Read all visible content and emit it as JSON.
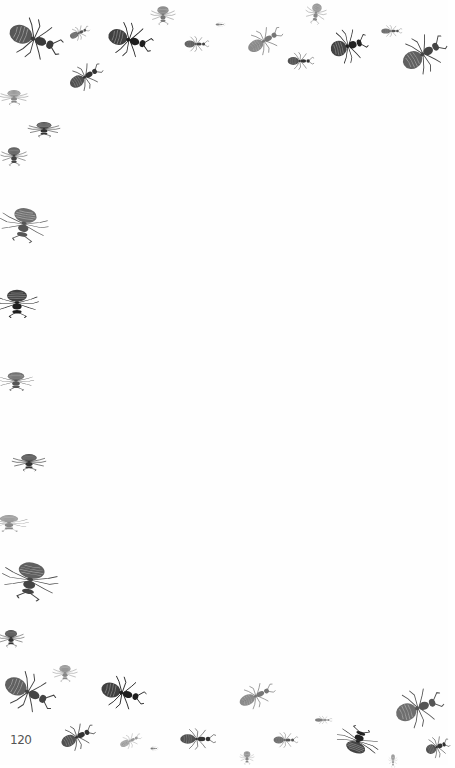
{
  "page": {
    "page_number": "120",
    "background": "#fefefe",
    "ink_color": "#2a2a2a",
    "border_motif": "ant-illustrations"
  },
  "ants": [
    {
      "x": 5,
      "y": 18,
      "w": 58,
      "h": 42,
      "rot": 20,
      "shade": "#3a3a3a"
    },
    {
      "x": 68,
      "y": 26,
      "w": 22,
      "h": 14,
      "rot": -25,
      "shade": "#555"
    },
    {
      "x": 105,
      "y": 22,
      "w": 48,
      "h": 36,
      "rot": 15,
      "shade": "#1e1e1e"
    },
    {
      "x": 153,
      "y": 2,
      "w": 20,
      "h": 26,
      "rot": 90,
      "shade": "#777"
    },
    {
      "x": 183,
      "y": 36,
      "w": 26,
      "h": 16,
      "rot": 0,
      "shade": "#444"
    },
    {
      "x": 66,
      "y": 64,
      "w": 38,
      "h": 26,
      "rot": -30,
      "shade": "#333"
    },
    {
      "x": 215,
      "y": 22,
      "w": 10,
      "h": 5,
      "rot": 0,
      "shade": "#666"
    },
    {
      "x": 244,
      "y": 28,
      "w": 40,
      "h": 26,
      "rot": -30,
      "shade": "#777"
    },
    {
      "x": 286,
      "y": 52,
      "w": 28,
      "h": 18,
      "rot": 0,
      "shade": "#333"
    },
    {
      "x": 305,
      "y": 2,
      "w": 22,
      "h": 22,
      "rot": 100,
      "shade": "#888"
    },
    {
      "x": 328,
      "y": 28,
      "w": 40,
      "h": 36,
      "rot": -15,
      "shade": "#222"
    },
    {
      "x": 380,
      "y": 25,
      "w": 22,
      "h": 12,
      "rot": 0,
      "shade": "#555"
    },
    {
      "x": 398,
      "y": 34,
      "w": 50,
      "h": 40,
      "rot": -30,
      "shade": "#444"
    },
    {
      "x": 6,
      "y": 82,
      "w": 16,
      "h": 30,
      "rot": 90,
      "shade": "#888"
    },
    {
      "x": 36,
      "y": 112,
      "w": 16,
      "h": 34,
      "rot": 90,
      "shade": "#333"
    },
    {
      "x": 4,
      "y": 142,
      "w": 20,
      "h": 28,
      "rot": 90,
      "shade": "#444"
    },
    {
      "x": 6,
      "y": 198,
      "w": 36,
      "h": 52,
      "rot": 100,
      "shade": "#555"
    },
    {
      "x": 2,
      "y": 280,
      "w": 30,
      "h": 46,
      "rot": 90,
      "shade": "#1e1e1e"
    },
    {
      "x": 6,
      "y": 362,
      "w": 20,
      "h": 38,
      "rot": 90,
      "shade": "#555"
    },
    {
      "x": 20,
      "y": 444,
      "w": 18,
      "h": 36,
      "rot": 90,
      "shade": "#333"
    },
    {
      "x": 0,
      "y": 502,
      "w": 18,
      "h": 42,
      "rot": 90,
      "shade": "#888"
    },
    {
      "x": 10,
      "y": 550,
      "w": 40,
      "h": 60,
      "rot": 100,
      "shade": "#444"
    },
    {
      "x": 2,
      "y": 624,
      "w": 18,
      "h": 28,
      "rot": 90,
      "shade": "#333"
    },
    {
      "x": 56,
      "y": 660,
      "w": 18,
      "h": 26,
      "rot": 90,
      "shade": "#888"
    },
    {
      "x": 0,
      "y": 672,
      "w": 56,
      "h": 40,
      "rot": 25,
      "shade": "#444"
    },
    {
      "x": 98,
      "y": 676,
      "w": 48,
      "h": 34,
      "rot": 15,
      "shade": "#1e1e1e"
    },
    {
      "x": 236,
      "y": 684,
      "w": 40,
      "h": 24,
      "rot": -25,
      "shade": "#777"
    },
    {
      "x": 392,
      "y": 688,
      "w": 52,
      "h": 40,
      "rot": -20,
      "shade": "#555"
    },
    {
      "x": 314,
      "y": 716,
      "w": 18,
      "h": 8,
      "rot": 0,
      "shade": "#666"
    },
    {
      "x": 58,
      "y": 724,
      "w": 38,
      "h": 26,
      "rot": -25,
      "shade": "#333"
    },
    {
      "x": 118,
      "y": 734,
      "w": 24,
      "h": 14,
      "rot": -25,
      "shade": "#999"
    },
    {
      "x": 150,
      "y": 746,
      "w": 8,
      "h": 5,
      "rot": 0,
      "shade": "#666"
    },
    {
      "x": 178,
      "y": 728,
      "w": 38,
      "h": 22,
      "rot": 0,
      "shade": "#333"
    },
    {
      "x": 272,
      "y": 732,
      "w": 26,
      "h": 16,
      "rot": 0,
      "shade": "#555"
    },
    {
      "x": 344,
      "y": 718,
      "w": 28,
      "h": 46,
      "rot": -70,
      "shade": "#222"
    },
    {
      "x": 240,
      "y": 750,
      "w": 14,
      "h": 15,
      "rot": 90,
      "shade": "#888"
    },
    {
      "x": 386,
      "y": 756,
      "w": 14,
      "h": 9,
      "rot": 90,
      "shade": "#999"
    },
    {
      "x": 424,
      "y": 736,
      "w": 26,
      "h": 22,
      "rot": -20,
      "shade": "#333"
    }
  ]
}
